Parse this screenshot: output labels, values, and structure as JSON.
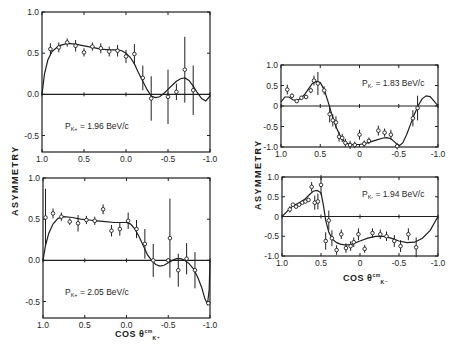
{
  "figure": {
    "left_ylabel": "ASYMMETRY",
    "right_ylabel": "ASYMMETRY",
    "left_xlabel": "COS θ",
    "left_xlabel_sub": "K⁺",
    "left_xlabel_sup": "cm",
    "right_xlabel": "COS θ",
    "right_xlabel_sub": "K⁻",
    "right_xlabel_sup": "cm"
  },
  "chart_data": [
    {
      "type": "scatter",
      "id": "panel-196",
      "title": "P_K+ = 1.96 BeV/c",
      "label": "PK+ = 1.96 BeV/c",
      "xlabel": "COS θ K+ cm",
      "ylabel": "ASYMMETRY",
      "xlim": [
        1.0,
        -1.0
      ],
      "ylim": [
        -0.7,
        1.0
      ],
      "xticks": [
        "1.0",
        "0.5",
        "0.0",
        "-0.5",
        "-1.0"
      ],
      "yticks": [
        "1.0",
        "0.5",
        "0.0",
        "-0.5"
      ],
      "frame": {
        "x": 42,
        "y": 12,
        "w": 168,
        "h": 140
      },
      "label_pos": {
        "x": 65,
        "y": 129
      },
      "points": [
        {
          "x": 0.9,
          "y": 0.55,
          "err": 0.07
        },
        {
          "x": 0.8,
          "y": 0.57,
          "err": 0.06
        },
        {
          "x": 0.7,
          "y": 0.63,
          "err": 0.05
        },
        {
          "x": 0.6,
          "y": 0.59,
          "err": 0.07
        },
        {
          "x": 0.5,
          "y": 0.51,
          "err": 0.05
        },
        {
          "x": 0.4,
          "y": 0.58,
          "err": 0.05
        },
        {
          "x": 0.3,
          "y": 0.56,
          "err": 0.06
        },
        {
          "x": 0.2,
          "y": 0.52,
          "err": 0.06
        },
        {
          "x": 0.1,
          "y": 0.53,
          "err": 0.07
        },
        {
          "x": 0.0,
          "y": 0.46,
          "err": 0.08
        },
        {
          "x": -0.1,
          "y": 0.49,
          "err": 0.12
        },
        {
          "x": -0.2,
          "y": 0.2,
          "err": 0.15
        },
        {
          "x": -0.3,
          "y": -0.05,
          "err": 0.27
        },
        {
          "x": -0.5,
          "y": -0.03,
          "err": 0.33
        },
        {
          "x": -0.6,
          "y": 0.03,
          "err": 0.1
        },
        {
          "x": -0.7,
          "y": 0.3,
          "err": 0.4
        },
        {
          "x": -0.8,
          "y": 0.05,
          "err": 0.3
        }
      ],
      "curve": [
        [
          1.0,
          0.0
        ],
        [
          0.97,
          0.25
        ],
        [
          0.93,
          0.42
        ],
        [
          0.88,
          0.52
        ],
        [
          0.8,
          0.59
        ],
        [
          0.7,
          0.62
        ],
        [
          0.6,
          0.61
        ],
        [
          0.5,
          0.59
        ],
        [
          0.4,
          0.57
        ],
        [
          0.3,
          0.55
        ],
        [
          0.2,
          0.54
        ],
        [
          0.1,
          0.54
        ],
        [
          0.05,
          0.53
        ],
        [
          0.0,
          0.5
        ],
        [
          -0.05,
          0.45
        ],
        [
          -0.1,
          0.37
        ],
        [
          -0.15,
          0.26
        ],
        [
          -0.2,
          0.16
        ],
        [
          -0.25,
          0.06
        ],
        [
          -0.3,
          -0.02
        ],
        [
          -0.35,
          -0.04
        ],
        [
          -0.4,
          -0.03
        ],
        [
          -0.45,
          0.01
        ],
        [
          -0.5,
          0.06
        ],
        [
          -0.55,
          0.11
        ],
        [
          -0.6,
          0.16
        ],
        [
          -0.65,
          0.19
        ],
        [
          -0.7,
          0.2
        ],
        [
          -0.75,
          0.17
        ],
        [
          -0.8,
          0.1
        ],
        [
          -0.85,
          0.02
        ],
        [
          -0.9,
          -0.05
        ],
        [
          -0.95,
          -0.08
        ],
        [
          -1.0,
          -0.02
        ]
      ]
    },
    {
      "type": "scatter",
      "id": "panel-205",
      "title": "P_K+ = 2.05 BeV/c",
      "label": "PK+ = 2.05 BeV/c",
      "xlabel": "COS θ K+ cm",
      "ylabel": "ASYMMETRY",
      "xlim": [
        1.0,
        -1.0
      ],
      "ylim": [
        -0.7,
        1.0
      ],
      "xticks": [
        "1.0",
        "0.5",
        "0.0",
        "-0.5",
        "-1.0"
      ],
      "yticks": [
        "1.0",
        "0.5",
        "0.0",
        "-0.5"
      ],
      "frame": {
        "x": 43,
        "y": 178,
        "w": 167,
        "h": 140
      },
      "label_pos": {
        "x": 65,
        "y": 295
      },
      "points": [
        {
          "x": 0.97,
          "y": 0.52,
          "err": 0.35
        },
        {
          "x": 0.88,
          "y": 0.57,
          "err": 0.06
        },
        {
          "x": 0.78,
          "y": 0.53,
          "err": 0.05
        },
        {
          "x": 0.68,
          "y": 0.47,
          "err": 0.04
        },
        {
          "x": 0.58,
          "y": 0.45,
          "err": 0.1
        },
        {
          "x": 0.48,
          "y": 0.49,
          "err": 0.05
        },
        {
          "x": 0.38,
          "y": 0.48,
          "err": 0.05
        },
        {
          "x": 0.28,
          "y": 0.62,
          "err": 0.06
        },
        {
          "x": 0.18,
          "y": 0.36,
          "err": 0.07
        },
        {
          "x": 0.08,
          "y": 0.38,
          "err": 0.08
        },
        {
          "x": -0.02,
          "y": 0.48,
          "err": 0.1
        },
        {
          "x": -0.12,
          "y": 0.38,
          "err": 0.11
        },
        {
          "x": -0.22,
          "y": 0.2,
          "err": 0.18
        },
        {
          "x": -0.32,
          "y": 0.0,
          "err": 0.2
        },
        {
          "x": -0.5,
          "y": 0.0,
          "err": 0.02
        },
        {
          "x": -0.52,
          "y": 0.27,
          "err": 0.48
        },
        {
          "x": -0.62,
          "y": -0.12,
          "err": 0.2
        },
        {
          "x": -0.72,
          "y": 0.02,
          "err": 0.19
        },
        {
          "x": -0.82,
          "y": -0.12,
          "err": 0.22
        },
        {
          "x": -0.98,
          "y": -0.52,
          "err": 0.02
        }
      ],
      "curve": [
        [
          1.0,
          0.0
        ],
        [
          0.97,
          0.18
        ],
        [
          0.93,
          0.33
        ],
        [
          0.88,
          0.44
        ],
        [
          0.82,
          0.51
        ],
        [
          0.75,
          0.53
        ],
        [
          0.65,
          0.52
        ],
        [
          0.55,
          0.5
        ],
        [
          0.45,
          0.49
        ],
        [
          0.35,
          0.48
        ],
        [
          0.25,
          0.47
        ],
        [
          0.15,
          0.46
        ],
        [
          0.05,
          0.46
        ],
        [
          0.0,
          0.46
        ],
        [
          -0.05,
          0.44
        ],
        [
          -0.1,
          0.38
        ],
        [
          -0.15,
          0.29
        ],
        [
          -0.2,
          0.18
        ],
        [
          -0.25,
          0.07
        ],
        [
          -0.3,
          0.0
        ],
        [
          -0.35,
          -0.05
        ],
        [
          -0.4,
          -0.07
        ],
        [
          -0.45,
          -0.06
        ],
        [
          -0.5,
          -0.03
        ],
        [
          -0.55,
          0.0
        ],
        [
          -0.6,
          0.02
        ],
        [
          -0.65,
          0.02
        ],
        [
          -0.7,
          0.0
        ],
        [
          -0.75,
          -0.04
        ],
        [
          -0.8,
          -0.1
        ],
        [
          -0.85,
          -0.2
        ],
        [
          -0.9,
          -0.33
        ],
        [
          -0.94,
          -0.47
        ],
        [
          -0.97,
          -0.53
        ],
        [
          -0.99,
          -0.35
        ],
        [
          -1.0,
          0.0
        ]
      ]
    },
    {
      "type": "scatter",
      "id": "panel-183",
      "title": "P_K- = 1.83 BeV/c",
      "label": "PK- = 1.83 BeV/c",
      "xlabel": "COS θ K- cm",
      "ylabel": "ASYMMETRY",
      "xlim": [
        1.0,
        -1.0
      ],
      "ylim": [
        -1.0,
        1.0
      ],
      "xticks": [
        "1.0",
        "0.5",
        "0",
        "-0.5",
        "-1.0"
      ],
      "yticks": [
        "1.0",
        "0.5",
        "0",
        "-0.5",
        "-1.0"
      ],
      "frame": {
        "x": 281,
        "y": 65,
        "w": 157,
        "h": 82
      },
      "label_pos": {
        "x": 362,
        "y": 86
      },
      "points": [
        {
          "x": 0.92,
          "y": 0.4,
          "err": 0.12
        },
        {
          "x": 0.86,
          "y": 0.25,
          "err": 0.05
        },
        {
          "x": 0.8,
          "y": 0.12,
          "err": 0.04
        },
        {
          "x": 0.74,
          "y": 0.2,
          "err": 0.04
        },
        {
          "x": 0.68,
          "y": 0.22,
          "err": 0.05
        },
        {
          "x": 0.62,
          "y": 0.38,
          "err": 0.07
        },
        {
          "x": 0.58,
          "y": 0.62,
          "err": 0.12
        },
        {
          "x": 0.53,
          "y": 0.55,
          "err": 0.28
        },
        {
          "x": 0.45,
          "y": 0.38,
          "err": 0.1
        },
        {
          "x": 0.38,
          "y": -0.2,
          "err": 0.2
        },
        {
          "x": 0.34,
          "y": -0.35,
          "err": 0.15
        },
        {
          "x": 0.3,
          "y": -0.4,
          "err": 0.15
        },
        {
          "x": 0.26,
          "y": -0.75,
          "err": 0.12
        },
        {
          "x": 0.22,
          "y": -0.78,
          "err": 0.1
        },
        {
          "x": 0.18,
          "y": -0.9,
          "err": 0.1
        },
        {
          "x": 0.12,
          "y": -0.95,
          "err": 0.1
        },
        {
          "x": 0.06,
          "y": -0.95,
          "err": 0.08
        },
        {
          "x": 0.0,
          "y": -0.7,
          "err": 0.12
        },
        {
          "x": -0.06,
          "y": -0.92,
          "err": 0.08
        },
        {
          "x": -0.12,
          "y": -0.85,
          "err": 0.08
        },
        {
          "x": -0.24,
          "y": -0.6,
          "err": 0.12
        },
        {
          "x": -0.32,
          "y": -0.65,
          "err": 0.1
        },
        {
          "x": -0.4,
          "y": -0.7,
          "err": 0.12
        },
        {
          "x": -0.48,
          "y": -0.98,
          "err": 0.08
        },
        {
          "x": -0.68,
          "y": -0.3,
          "err": 0.2
        },
        {
          "x": -0.74,
          "y": -0.05,
          "err": 0.3
        }
      ],
      "curve": [
        [
          1.0,
          0.1
        ],
        [
          0.95,
          0.22
        ],
        [
          0.9,
          0.22
        ],
        [
          0.85,
          0.15
        ],
        [
          0.8,
          0.13
        ],
        [
          0.75,
          0.18
        ],
        [
          0.7,
          0.28
        ],
        [
          0.65,
          0.42
        ],
        [
          0.6,
          0.55
        ],
        [
          0.55,
          0.6
        ],
        [
          0.5,
          0.57
        ],
        [
          0.45,
          0.4
        ],
        [
          0.4,
          0.1
        ],
        [
          0.35,
          -0.22
        ],
        [
          0.3,
          -0.5
        ],
        [
          0.25,
          -0.72
        ],
        [
          0.2,
          -0.85
        ],
        [
          0.15,
          -0.92
        ],
        [
          0.1,
          -0.94
        ],
        [
          0.0,
          -0.94
        ],
        [
          -0.1,
          -0.9
        ],
        [
          -0.2,
          -0.84
        ],
        [
          -0.3,
          -0.78
        ],
        [
          -0.35,
          -0.77
        ],
        [
          -0.4,
          -0.8
        ],
        [
          -0.45,
          -0.88
        ],
        [
          -0.5,
          -0.98
        ],
        [
          -0.55,
          -0.9
        ],
        [
          -0.6,
          -0.7
        ],
        [
          -0.65,
          -0.45
        ],
        [
          -0.7,
          -0.2
        ],
        [
          -0.75,
          0.02
        ],
        [
          -0.8,
          0.18
        ],
        [
          -0.85,
          0.25
        ],
        [
          -0.9,
          0.23
        ],
        [
          -0.95,
          0.12
        ],
        [
          -1.0,
          0.0
        ]
      ]
    },
    {
      "type": "scatter",
      "id": "panel-194",
      "title": "P_K- = 1.94 BeV/c",
      "label": "PK- = 1.94 BeV/c",
      "xlabel": "COS θ K- cm",
      "ylabel": "ASYMMETRY",
      "xlim": [
        1.0,
        -1.0
      ],
      "ylim": [
        -1.0,
        1.0
      ],
      "xticks": [
        "1.0",
        "0.5",
        "0",
        "-0.5",
        "-1.0"
      ],
      "yticks": [
        "1.0",
        "0.5",
        "0",
        "-0.5",
        "-1.0"
      ],
      "frame": {
        "x": 282,
        "y": 177,
        "w": 156,
        "h": 79
      },
      "label_pos": {
        "x": 362,
        "y": 197
      },
      "points": [
        {
          "x": 0.9,
          "y": 0.18,
          "err": 0.08
        },
        {
          "x": 0.86,
          "y": 0.3,
          "err": 0.04
        },
        {
          "x": 0.82,
          "y": 0.25,
          "err": 0.04
        },
        {
          "x": 0.78,
          "y": 0.3,
          "err": 0.04
        },
        {
          "x": 0.74,
          "y": 0.35,
          "err": 0.04
        },
        {
          "x": 0.7,
          "y": 0.38,
          "err": 0.04
        },
        {
          "x": 0.66,
          "y": 0.42,
          "err": 0.05
        },
        {
          "x": 0.62,
          "y": 0.75,
          "err": 0.12
        },
        {
          "x": 0.58,
          "y": 0.35,
          "err": 0.18
        },
        {
          "x": 0.54,
          "y": 0.38,
          "err": 0.2
        },
        {
          "x": 0.5,
          "y": 0.8,
          "err": 0.25
        },
        {
          "x": 0.44,
          "y": -0.62,
          "err": 0.22
        },
        {
          "x": 0.4,
          "y": -0.1,
          "err": 0.25
        },
        {
          "x": 0.36,
          "y": -0.55,
          "err": 0.2
        },
        {
          "x": 0.3,
          "y": -0.85,
          "err": 0.12
        },
        {
          "x": 0.24,
          "y": -0.45,
          "err": 0.12
        },
        {
          "x": 0.18,
          "y": -0.8,
          "err": 0.12
        },
        {
          "x": 0.12,
          "y": -0.75,
          "err": 0.12
        },
        {
          "x": 0.08,
          "y": -0.65,
          "err": 0.12
        },
        {
          "x": 0.02,
          "y": -0.45,
          "err": 0.15
        },
        {
          "x": -0.06,
          "y": -0.82,
          "err": 0.1
        },
        {
          "x": -0.16,
          "y": -0.42,
          "err": 0.12
        },
        {
          "x": -0.26,
          "y": -0.45,
          "err": 0.12
        },
        {
          "x": -0.34,
          "y": -0.5,
          "err": 0.12
        },
        {
          "x": -0.44,
          "y": -0.62,
          "err": 0.15
        },
        {
          "x": -0.52,
          "y": -0.75,
          "err": 0.15
        },
        {
          "x": -0.62,
          "y": -0.45,
          "err": 0.15
        },
        {
          "x": -0.72,
          "y": -0.78,
          "err": 0.25
        }
      ],
      "curve": [
        [
          1.0,
          0.0
        ],
        [
          0.95,
          0.1
        ],
        [
          0.9,
          0.2
        ],
        [
          0.85,
          0.28
        ],
        [
          0.8,
          0.33
        ],
        [
          0.75,
          0.38
        ],
        [
          0.7,
          0.45
        ],
        [
          0.65,
          0.55
        ],
        [
          0.6,
          0.64
        ],
        [
          0.55,
          0.66
        ],
        [
          0.5,
          0.6
        ],
        [
          0.47,
          0.3
        ],
        [
          0.44,
          -0.1
        ],
        [
          0.4,
          -0.4
        ],
        [
          0.35,
          -0.58
        ],
        [
          0.3,
          -0.66
        ],
        [
          0.25,
          -0.7
        ],
        [
          0.2,
          -0.72
        ],
        [
          0.15,
          -0.72
        ],
        [
          0.1,
          -0.7
        ],
        [
          0.0,
          -0.62
        ],
        [
          -0.1,
          -0.55
        ],
        [
          -0.2,
          -0.5
        ],
        [
          -0.3,
          -0.5
        ],
        [
          -0.4,
          -0.55
        ],
        [
          -0.5,
          -0.62
        ],
        [
          -0.6,
          -0.66
        ],
        [
          -0.7,
          -0.65
        ],
        [
          -0.8,
          -0.55
        ],
        [
          -0.9,
          -0.35
        ],
        [
          -1.0,
          0.0
        ]
      ]
    }
  ]
}
